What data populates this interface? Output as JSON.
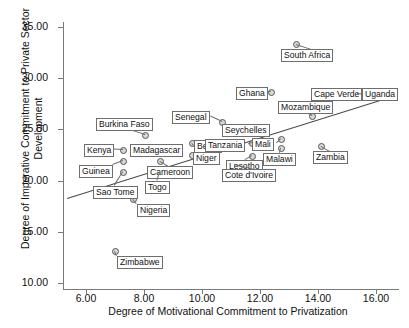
{
  "chart_data": {
    "type": "scatter",
    "title": "",
    "xlabel": "Degree of Motivational Commitment to Privatization",
    "ylabel": "Degree of Imperative Commitment to Private Sector Development",
    "xlim": [
      5.2,
      17.0
    ],
    "ylim": [
      8.6,
      36.2
    ],
    "xticks": [
      "6.00",
      "8.00",
      "10.00",
      "12.00",
      "14.00",
      "16.00"
    ],
    "yticks": [
      "10.00",
      "15.00",
      "20.00",
      "25.00",
      "30.00",
      "35.00"
    ],
    "grid": false,
    "legend": null,
    "marker_color": "#d8d8d8",
    "marker_edge_color": "#555555",
    "fit_line_color": "#4a4a4a",
    "fit_line": {
      "x0": 5.35,
      "y0": 18.3,
      "x1": 16.3,
      "y1": 28.0
    },
    "points": [
      {
        "label": "Burkina Faso",
        "x": 7.0,
        "y": 23.5,
        "px": 145,
        "py": 135,
        "lx": 96,
        "ly": 118
      },
      {
        "label": "Kenya",
        "x": 7.0,
        "y": 22.0,
        "px": 123,
        "py": 150,
        "lx": 84,
        "ly": 144
      },
      {
        "label": "Madagascar",
        "x": 8.0,
        "y": 22.2,
        "px": 160,
        "py": 147,
        "lx": 130,
        "ly": 144
      },
      {
        "label": "Guinea",
        "x": 7.0,
        "y": 21.0,
        "px": 123,
        "py": 161,
        "lx": 79,
        "ly": 165
      },
      {
        "label": "Sao Tome",
        "x": 7.0,
        "y": 20.0,
        "px": 123,
        "py": 172,
        "lx": 93,
        "ly": 186
      },
      {
        "label": "Cameroon",
        "x": 8.0,
        "y": 21.0,
        "px": 160,
        "py": 161,
        "lx": 147,
        "ly": 166
      },
      {
        "label": "Togo",
        "x": 8.0,
        "y": 20.0,
        "px": 160,
        "py": 172,
        "lx": 145,
        "ly": 181
      },
      {
        "label": "Benin",
        "x": 9.0,
        "y": 22.6,
        "px": 192,
        "py": 143,
        "lx": 194,
        "ly": 140
      },
      {
        "label": "Niger",
        "x": 9.0,
        "y": 21.4,
        "px": 192,
        "py": 155,
        "lx": 193,
        "ly": 152
      },
      {
        "label": "Senegal",
        "x": 10.0,
        "y": 24.0,
        "px": 222,
        "py": 122,
        "lx": 172,
        "ly": 111
      },
      {
        "label": "Nigeria",
        "x": 8.0,
        "y": 17.0,
        "px": 133,
        "py": 199,
        "lx": 137,
        "ly": 204
      },
      {
        "label": "Zimbabwe",
        "x": 7.0,
        "y": 13.0,
        "px": 115,
        "py": 251,
        "lx": 117,
        "ly": 256
      },
      {
        "label": "Seychelles",
        "x": 11.0,
        "y": 23.6,
        "px": 252,
        "py": 131,
        "lx": 222,
        "ly": 124
      },
      {
        "label": "Tanzania",
        "x": 11.0,
        "y": 22.6,
        "px": 252,
        "py": 143,
        "lx": 205,
        "ly": 139
      },
      {
        "label": "Mali",
        "x": 12.0,
        "y": 23.0,
        "px": 281,
        "py": 139,
        "lx": 252,
        "ly": 138
      },
      {
        "label": "Lesotho",
        "x": 11.0,
        "y": 21.3,
        "px": 252,
        "py": 156,
        "lx": 226,
        "ly": 160
      },
      {
        "label": "Cote d'Ivoire",
        "x": 12.0,
        "y": 20.6,
        "px": 234,
        "py": 164,
        "lx": 222,
        "ly": 169
      },
      {
        "label": "Ghana",
        "x": 12.0,
        "y": 27.6,
        "px": 271,
        "py": 92,
        "lx": 236,
        "ly": 87
      },
      {
        "label": "Malawi",
        "x": 12.0,
        "y": 22.1,
        "px": 281,
        "py": 148,
        "lx": 263,
        "ly": 153
      },
      {
        "label": "Mozambique",
        "x": 13.0,
        "y": 26.2,
        "px": 312,
        "py": 116,
        "lx": 278,
        "ly": 101
      },
      {
        "label": "South Africa",
        "x": 13.0,
        "y": 32.5,
        "px": 296,
        "py": 44,
        "lx": 281,
        "ly": 49
      },
      {
        "label": "Zambia",
        "x": 14.0,
        "y": 22.3,
        "px": 321,
        "py": 146,
        "lx": 313,
        "ly": 151
      },
      {
        "label": "Cape Verde",
        "x": 15.0,
        "y": 26.8,
        "px": 350,
        "py": 93,
        "lx": 311,
        "ly": 88
      },
      {
        "label": "Uganda",
        "x": 15.0,
        "y": 26.8,
        "px": 357,
        "py": 93,
        "lx": 362,
        "ly": 88
      }
    ]
  }
}
